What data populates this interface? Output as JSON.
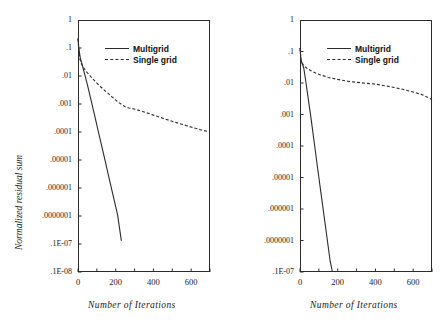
{
  "figure": {
    "panels": [
      {
        "id": "left",
        "axis": {
          "xlabel": "Number of  Iterations",
          "ylabel": "Normalized residual sum",
          "xticks": [
            "0",
            "200",
            "400",
            "600"
          ],
          "xtick_values": [
            0,
            200,
            400,
            600
          ],
          "xlim": [
            0,
            700
          ],
          "yticks": [
            "1",
            ".1",
            ".01",
            ".001",
            ".0001",
            ".00001",
            ".000001",
            ".0000001",
            ".1E-07",
            ".1E-08"
          ],
          "ytick_values": [
            1,
            0.1,
            0.01,
            0.001,
            0.0001,
            1e-05,
            1e-06,
            1e-07,
            1e-08,
            1e-09
          ],
          "ylim": [
            1e-09,
            1
          ]
        },
        "legend": [
          {
            "label": "Multigrid",
            "style": "solid"
          },
          {
            "label": "Single grid",
            "style": "dashed"
          }
        ]
      },
      {
        "id": "right",
        "axis": {
          "xlabel": "Number of  Iterations",
          "ylabel": "",
          "xticks": [
            "0",
            "200",
            "400",
            "600"
          ],
          "xtick_values": [
            0,
            200,
            400,
            600
          ],
          "xlim": [
            0,
            700
          ],
          "yticks": [
            "1",
            ".1",
            ".01",
            ".001",
            ".0001",
            ".00001",
            ".000001",
            ".0000001",
            ".1E-07"
          ],
          "ytick_values": [
            1,
            0.1,
            0.01,
            0.001,
            0.0001,
            1e-05,
            1e-06,
            1e-07,
            1e-08
          ],
          "ylim": [
            1e-08,
            1
          ]
        },
        "legend": [
          {
            "label": "Multigrid",
            "style": "solid"
          },
          {
            "label": "Single grid",
            "style": "dashed"
          }
        ]
      }
    ]
  },
  "chart_data": [
    {
      "type": "line",
      "title": "",
      "panel": "left",
      "xlabel": "Number of  Iterations",
      "ylabel": "Normalized residual sum",
      "xlim": [
        0,
        700
      ],
      "ylim": [
        1e-09,
        1
      ],
      "yscale": "log",
      "grid": false,
      "legend_position": "top-center",
      "series": [
        {
          "name": "Multigrid",
          "style": "solid",
          "x": [
            0,
            5,
            12,
            20,
            35,
            50,
            70,
            90,
            110,
            130,
            150,
            170,
            190,
            210,
            230
          ],
          "y": [
            0.22,
            0.09,
            0.045,
            0.028,
            0.012,
            0.0048,
            0.0013,
            0.00035,
            9e-05,
            2.4e-05,
            6.2e-06,
            1.6e-06,
            4.2e-07,
            1.1e-07,
            1.3e-08
          ]
        },
        {
          "name": "Single grid",
          "style": "dashed",
          "x": [
            0,
            4,
            10,
            18,
            26,
            34,
            42,
            50,
            60,
            70,
            80,
            90,
            100,
            115,
            130,
            145,
            160,
            175,
            190,
            210,
            230,
            250,
            270,
            290,
            310,
            350,
            400,
            450,
            500,
            550,
            600,
            650,
            700
          ],
          "y": [
            0.22,
            0.085,
            0.04,
            0.028,
            0.022,
            0.018,
            0.015,
            0.013,
            0.011,
            0.0092,
            0.0078,
            0.0066,
            0.0056,
            0.0044,
            0.0036,
            0.0029,
            0.0024,
            0.0019,
            0.0016,
            0.0012,
            0.00098,
            0.0008,
            0.00072,
            0.00068,
            0.00063,
            0.00052,
            0.0004,
            0.00031,
            0.00024,
            0.00019,
            0.00015,
            0.00012,
            0.0001
          ]
        }
      ]
    },
    {
      "type": "line",
      "title": "",
      "panel": "right",
      "xlabel": "Number of  Iterations",
      "ylabel": "",
      "xlim": [
        0,
        700
      ],
      "ylim": [
        1e-08,
        1
      ],
      "yscale": "log",
      "grid": false,
      "legend_position": "top-center",
      "series": [
        {
          "name": "Multigrid",
          "style": "solid",
          "x": [
            0,
            5,
            12,
            20,
            30,
            45,
            60,
            80,
            100,
            120,
            140,
            160,
            172
          ],
          "y": [
            0.13,
            0.055,
            0.04,
            0.03,
            0.012,
            0.0028,
            0.00065,
            8e-05,
            1e-05,
            1.3e-06,
            1.7e-07,
            2.2e-08,
            1e-08
          ]
        },
        {
          "name": "Single grid",
          "style": "dashed",
          "x": [
            0,
            5,
            12,
            20,
            35,
            55,
            80,
            110,
            150,
            200,
            250,
            300,
            350,
            400,
            450,
            500,
            550,
            600,
            650,
            700
          ],
          "y": [
            0.13,
            0.055,
            0.042,
            0.036,
            0.03,
            0.025,
            0.021,
            0.018,
            0.015,
            0.013,
            0.0115,
            0.0105,
            0.0098,
            0.0092,
            0.0082,
            0.0072,
            0.0062,
            0.0052,
            0.0042,
            0.003
          ]
        }
      ]
    }
  ]
}
